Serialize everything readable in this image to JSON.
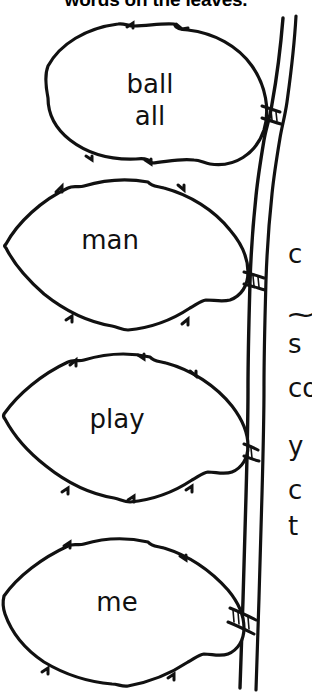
{
  "page": {
    "title": "words on the leaves.",
    "background_color": "#ffffff",
    "ink_color": "#000000"
  },
  "heading": {
    "text": "words on the leaves.",
    "clipped": "top"
  },
  "illustration": {
    "name": "branch-with-leaves",
    "branch_label": "branch",
    "leaf_count": 4
  },
  "leaves": [
    {
      "id": "leaf-1",
      "lines": [
        "ball",
        "all"
      ],
      "line1": "ball",
      "line2": "all"
    },
    {
      "id": "leaf-2",
      "lines": [
        "man"
      ],
      "line1": "man",
      "line2": ""
    },
    {
      "id": "leaf-3",
      "lines": [
        "play"
      ],
      "line1": "play",
      "line2": ""
    },
    {
      "id": "leaf-4",
      "lines": [
        "me"
      ],
      "line1": "me",
      "line2": ""
    }
  ],
  "side_column": {
    "clipped": "right",
    "fragments": [
      {
        "id": "frag-0",
        "text": "c"
      },
      {
        "id": "frag-1",
        "text": "⁓"
      },
      {
        "id": "frag-2",
        "text": "s"
      },
      {
        "id": "frag-3",
        "text": "co"
      },
      {
        "id": "frag-4",
        "text": "y"
      },
      {
        "id": "frag-5",
        "text": "c"
      },
      {
        "id": "frag-6",
        "text": "t"
      }
    ]
  }
}
